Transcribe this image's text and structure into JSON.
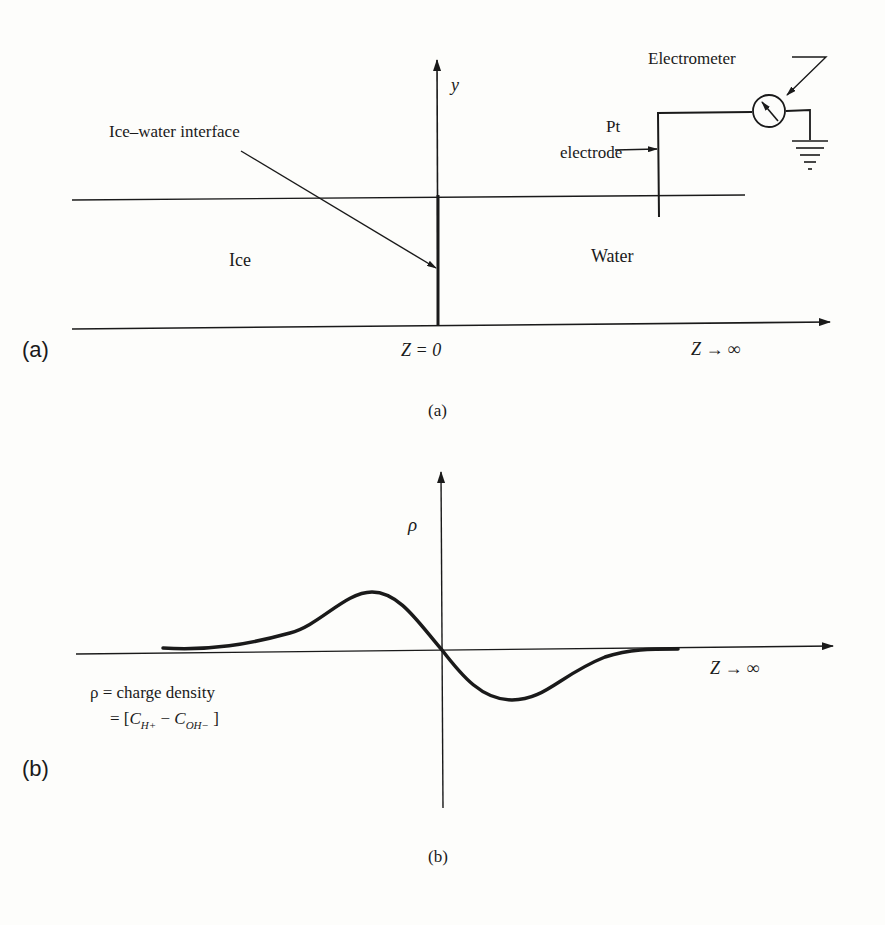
{
  "panel_a": {
    "tag": "(a)",
    "caption": "(a)",
    "y_axis_label": "y",
    "origin_label": "Z = 0",
    "z_infinity_label": "Z → ∞",
    "interface_label": "Ice–water interface",
    "ice_label": "Ice",
    "water_label": "Water",
    "electrode_label_line1": "Pt",
    "electrode_label_line2": "electrode",
    "electrometer_label": "Electrometer"
  },
  "panel_b": {
    "tag": "(b)",
    "caption": "(b)",
    "y_axis_label": "ρ",
    "z_infinity_label": "Z → ∞",
    "definition_line1": "ρ = charge density",
    "definition_line2_prefix": "= [",
    "definition_c1": "C",
    "definition_c1_sub": "H+",
    "definition_minus": " − ",
    "definition_c2": "C",
    "definition_c2_sub": "OH−",
    "definition_line2_suffix": " ]"
  },
  "colors": {
    "ink": "#1a1a1a",
    "paper": "#fdfdfb"
  }
}
